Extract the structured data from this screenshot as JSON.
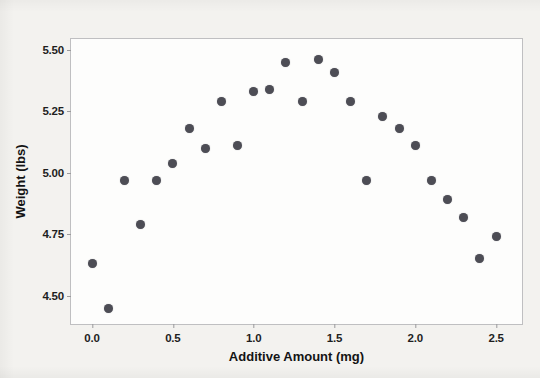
{
  "chart_data": {
    "type": "scatter",
    "title": "",
    "xlabel": "Additive Amount (mg)",
    "ylabel": "Weight (lbs)",
    "xlim": [
      -0.13,
      2.66
    ],
    "ylim": [
      4.385,
      5.545
    ],
    "xticks": [
      0.0,
      0.5,
      1.0,
      1.5,
      2.0,
      2.5
    ],
    "xticklabels": [
      "0.0",
      "0.5",
      "1.0",
      "1.5",
      "2.0",
      "2.5"
    ],
    "yticks": [
      4.5,
      4.75,
      5.0,
      5.25,
      5.5
    ],
    "yticklabels": [
      "4.50",
      "4.75",
      "5.00",
      "5.25",
      "5.50"
    ],
    "grid": false,
    "legend": null,
    "marker": {
      "shape": "circle",
      "color": "#4d4d55",
      "size_px": 9
    },
    "series": [
      {
        "name": "Weight vs Additive Amount",
        "x": [
          0.0,
          0.1,
          0.2,
          0.3,
          0.4,
          0.5,
          0.6,
          0.7,
          0.8,
          0.9,
          1.0,
          1.1,
          1.2,
          1.3,
          1.4,
          1.5,
          1.6,
          1.7,
          1.8,
          1.9,
          2.0,
          2.1,
          2.2,
          2.3,
          2.4,
          2.5
        ],
        "y": [
          4.63,
          4.45,
          4.97,
          4.79,
          4.97,
          5.04,
          5.18,
          5.1,
          5.29,
          5.11,
          5.33,
          5.34,
          5.45,
          5.29,
          5.46,
          5.41,
          5.29,
          4.97,
          5.23,
          5.18,
          5.11,
          4.97,
          4.89,
          4.82,
          4.65,
          4.74
        ]
      }
    ]
  },
  "figure": {
    "background_color": "#f3f2ef",
    "plot_background_color": "#fdfdfc",
    "frame_color": "#bfbfc1",
    "text_color": "#141414"
  }
}
